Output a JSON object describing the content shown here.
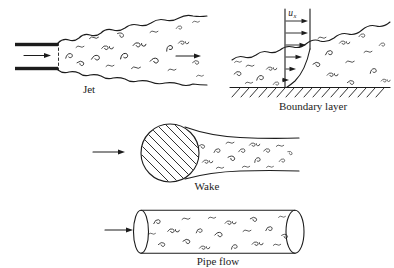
{
  "colors": {
    "ink": "#1c1c1c",
    "paper": "#ffffff"
  },
  "figure": {
    "labels": {
      "jet": "Jet",
      "boundary_layer": "Boundary layer",
      "wake": "Wake",
      "pipe_flow": "Pipe flow",
      "velocity_symbol": "u",
      "velocity_subscript": "x"
    }
  }
}
